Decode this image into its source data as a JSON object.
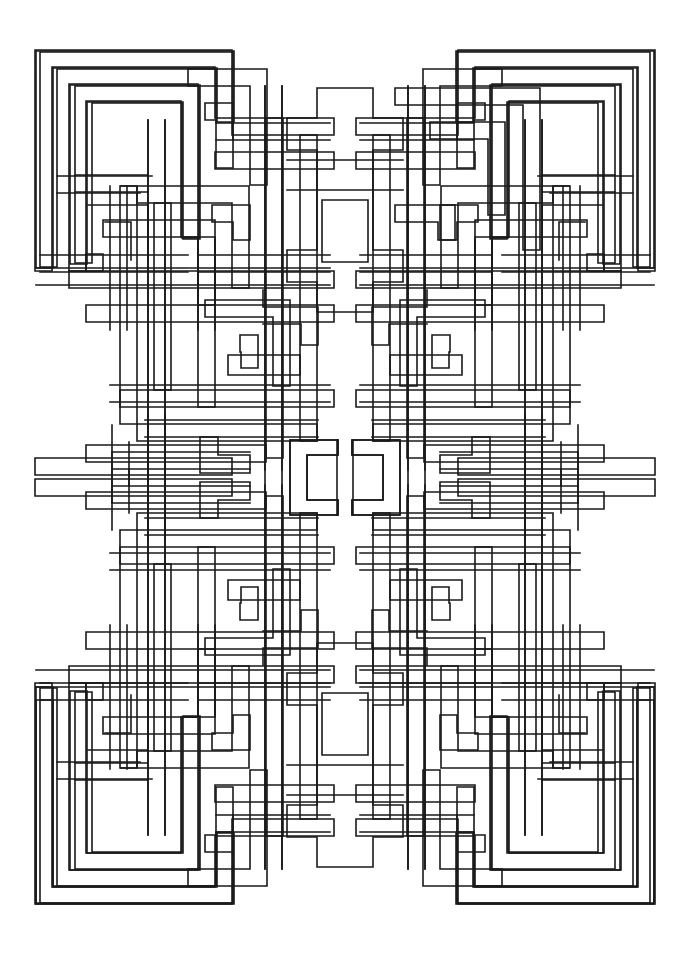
{
  "document": {
    "kind": "line-art-illustration",
    "subject": "Celtic interlaced knot / Greek-key maze pattern",
    "style": "black outline on white, coloring-book line drawing",
    "canvas": {
      "width": 690,
      "height": 955,
      "background": "#ffffff"
    }
  },
  "artwork": {
    "title": "Symmetric Celtic Knot",
    "stroke_color": "#1a1a1a",
    "fill_color": "#ffffff",
    "stroke_width": 1.6,
    "band_width": 17,
    "symmetry": "4-fold mirror (vertical axis x=345, horizontal axis y=477)",
    "bounds": {
      "left": 35,
      "top": 50,
      "right": 650,
      "bottom": 905
    },
    "center": {
      "x": 345,
      "y": 477
    },
    "motifs": [
      "corner spiral blocks",
      "greek-key hooks",
      "central mirrored bracket pair",
      "cross / plus medallion at top and bottom centers",
      "interlacing over-under crossings"
    ]
  },
  "geometry": {
    "quadrant_paths": [
      "M 35 271 L 35 50 L 232 50 L 232 118 L 215 118 L 215 67 L 52 67 L 52 271 Z",
      "M 69 271 L 69 84 L 198 84 L 198 237 L 181 237 L 181 101 L 86 101 L 86 271 Z",
      "M 232 135 L 334 135 L 334 118 L 232 118 Z",
      "M 215 152 L 334 152 L 334 169 L 215 169 Z",
      "M 120 186 L 249 186 L 249 288 L 232 288 L 232 203 L 137 203 L 137 186 Z",
      "M 103 220 L 215 220 L 215 305 L 198 305 L 198 237 L 103 237 Z",
      "M 103 254 L 86 254 L 86 271 L 103 271 Z",
      "M 69 271 L 334 271 L 334 288 L 69 288 Z",
      "M 86 305 L 334 305 L 334 322 L 86 322 Z",
      "M 120 186 L 137 186 L 137 424 L 120 424 Z",
      "M 154 203 L 171 203 L 171 390 L 154 390 Z",
      "M 198 237 L 215 237 L 215 407 L 198 407 Z",
      "M 266 118 L 283 118 L 283 458 L 266 458 Z",
      "M 300 135 L 317 135 L 317 441 L 300 441 Z",
      "M 120 390 L 334 390 L 334 407 L 120 407 Z",
      "M 137 424 L 317 424 L 317 441 L 137 441 Z",
      "M 35 458 L 232 458 L 232 475 L 35 475 Z",
      "M 86 492 L 266 492 L 266 509 L 86 509 Z"
    ],
    "crossings": 42,
    "note": "Paths are mirrored about x=345 and y=477 to complete the full design."
  }
}
